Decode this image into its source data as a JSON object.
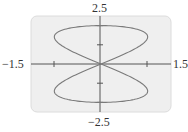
{
  "chart_data": {
    "type": "line",
    "title": "",
    "xlabel": "",
    "ylabel": "",
    "xlim": [
      -1.5,
      1.5
    ],
    "ylim": [
      -2.5,
      2.5
    ],
    "grid": false,
    "legend": null,
    "tick_labels": {
      "x_min": "−1.5",
      "x_max": "1.5",
      "y_max": "2.5",
      "y_min": "−2.5"
    },
    "x_ticks": [
      -1,
      1
    ],
    "y_ticks": [
      -2,
      -1,
      1,
      2
    ],
    "series": [
      {
        "name": "curve",
        "parametric": {
          "x": "sin(2t)",
          "y": "2cos(t)",
          "t_range": [
            0,
            6.2832
          ]
        },
        "sample_points": [
          [
            0,
            2
          ],
          [
            0.5,
            1.93
          ],
          [
            0.87,
            1.73
          ],
          [
            1.0,
            1.41
          ],
          [
            0.87,
            1.0
          ],
          [
            0.5,
            0.52
          ],
          [
            0,
            0
          ],
          [
            -0.5,
            -0.52
          ],
          [
            -0.87,
            -1.0
          ],
          [
            -1.0,
            -1.41
          ],
          [
            -0.87,
            -1.73
          ],
          [
            -0.5,
            -1.93
          ],
          [
            0,
            -2
          ],
          [
            0.5,
            -1.93
          ],
          [
            0.87,
            -1.73
          ],
          [
            1.0,
            -1.41
          ],
          [
            0.87,
            -1.0
          ],
          [
            0.5,
            -0.52
          ],
          [
            0,
            0
          ],
          [
            -0.5,
            0.52
          ],
          [
            -0.87,
            1.0
          ],
          [
            -1.0,
            1.41
          ],
          [
            -0.87,
            1.73
          ],
          [
            -0.5,
            1.93
          ],
          [
            0,
            2
          ]
        ]
      }
    ],
    "colors": {
      "plot_background": "#efefef",
      "curve": "#7a7a7a",
      "axes": "#555555",
      "frame": "#dcdcdc"
    }
  }
}
